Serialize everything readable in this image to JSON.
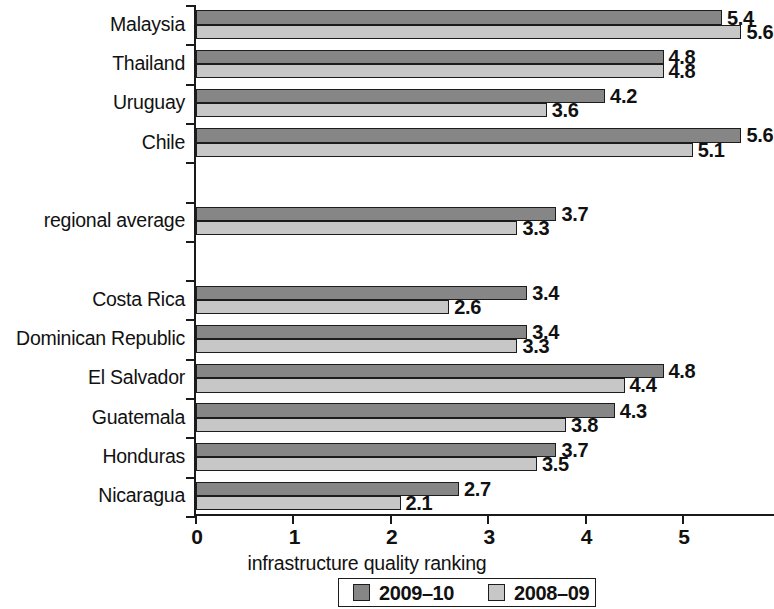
{
  "chart_data": {
    "type": "bar",
    "orientation": "horizontal",
    "title": "",
    "xlabel": "infrastructure quality ranking",
    "ylabel": "",
    "xlim": [
      0,
      5.8
    ],
    "xticks": [
      "0",
      "1",
      "2",
      "3",
      "4",
      "5"
    ],
    "grid": false,
    "legend_position": "bottom",
    "categories": [
      "Malaysia",
      "Thailand",
      "Uruguay",
      "Chile",
      "",
      "regional average",
      "",
      "Costa Rica",
      "Dominican Republic",
      "El Salvador",
      "Guatemala",
      "Honduras",
      "Nicaragua"
    ],
    "series": [
      {
        "name": "2009–10",
        "color": "#868686",
        "values": [
          5.4,
          4.8,
          4.2,
          5.6,
          null,
          3.7,
          null,
          3.4,
          3.4,
          4.8,
          4.3,
          3.7,
          2.7
        ],
        "labels": [
          "5.4",
          "4.8",
          "4.2",
          "5.6",
          "",
          "3.7",
          "",
          "3.4",
          "3.4",
          "4.8",
          "4.3",
          "3.7",
          "2.7"
        ]
      },
      {
        "name": "2008–09",
        "color": "#c7c7c7",
        "values": [
          5.6,
          4.8,
          3.6,
          5.1,
          null,
          3.3,
          null,
          2.6,
          3.3,
          4.4,
          3.8,
          3.5,
          2.1
        ],
        "labels": [
          "5.6",
          "4.8",
          "3.6",
          "5.1",
          "",
          "3.3",
          "",
          "2.6",
          "3.3",
          "4.4",
          "3.8",
          "3.5",
          "2.1"
        ]
      }
    ]
  }
}
